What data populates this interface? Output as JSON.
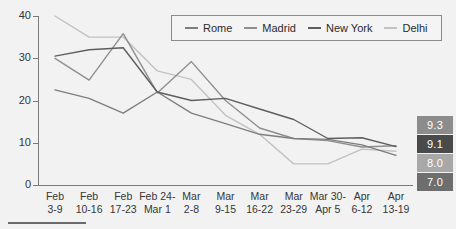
{
  "chart_data": {
    "type": "line",
    "title": "",
    "subtitle": "",
    "xlabel": "",
    "ylabel": "",
    "ylim": [
      0,
      40
    ],
    "yticks": [
      0,
      10,
      20,
      30,
      40
    ],
    "grid": false,
    "legend_position": "top-center",
    "categories": [
      "Feb 3-9",
      "Feb 10-16",
      "Feb 17-23",
      "Feb 24-Mar 1",
      "Mar 2-8",
      "Mar 9-15",
      "Mar 16-22",
      "Mar 23-29",
      "Mar 30-Apr 5",
      "Apr 6-12",
      "Apr 13-19"
    ],
    "category_lines": [
      [
        "Feb",
        "3-9"
      ],
      [
        "Feb",
        "10-16"
      ],
      [
        "Feb",
        "17-23"
      ],
      [
        "Feb 24-",
        "Mar 1"
      ],
      [
        "Mar",
        "2-8"
      ],
      [
        "Mar",
        "9-15"
      ],
      [
        "Mar",
        "16-22"
      ],
      [
        "Mar",
        "23-29"
      ],
      [
        "Mar 30-",
        "Apr 5"
      ],
      [
        "Apr",
        "6-12"
      ],
      [
        "Apr",
        "13-19"
      ]
    ],
    "series": [
      {
        "name": "Rome",
        "color": "#7e7e7e",
        "values": [
          22.5,
          20.5,
          17.0,
          22.0,
          17.0,
          14.5,
          12.0,
          11.0,
          10.8,
          9.5,
          7.0
        ]
      },
      {
        "name": "Madrid",
        "color": "#8f8f8f",
        "values": [
          30.0,
          24.8,
          35.8,
          21.8,
          29.2,
          20.0,
          13.5,
          11.0,
          10.5,
          9.0,
          9.3
        ]
      },
      {
        "name": "New York",
        "color": "#5e5e5e",
        "values": [
          30.5,
          32.0,
          32.5,
          22.0,
          20.0,
          20.5,
          18.0,
          15.5,
          11.0,
          11.2,
          9.1
        ]
      },
      {
        "name": "Delhi",
        "color": "#c2c2c2",
        "values": [
          40.0,
          35.0,
          35.0,
          27.0,
          25.0,
          16.5,
          12.0,
          5.0,
          5.0,
          8.5,
          8.0
        ]
      }
    ],
    "end_labels": [
      {
        "value": "9.3",
        "series": "Madrid",
        "background": "#8c8c8c"
      },
      {
        "value": "9.1",
        "series": "New York",
        "background": "#4a4a4a"
      },
      {
        "value": "8.0",
        "series": "Delhi",
        "background": "#a8a8a8"
      },
      {
        "value": "7.0",
        "series": "Rome",
        "background": "#6e6e6e"
      }
    ]
  },
  "legend": {
    "items": [
      {
        "label": "Rome"
      },
      {
        "label": "Madrid"
      },
      {
        "label": "New York"
      },
      {
        "label": "Delhi"
      }
    ]
  }
}
